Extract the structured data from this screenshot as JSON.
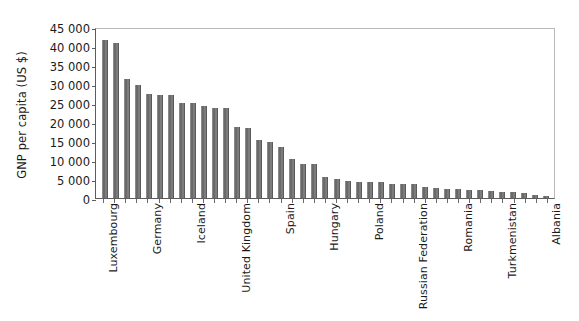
{
  "figure": {
    "top_clipped_text": "",
    "background_color": "#ffffff",
    "bar_color": "#6a6a6a",
    "axis_color": "#5c5c5c"
  },
  "chart_data": {
    "type": "bar",
    "title": "",
    "xlabel": "",
    "ylabel": "GNP per capita (US $)",
    "ylim": [
      0,
      45000
    ],
    "ytick_values": [
      0,
      5000,
      10000,
      15000,
      20000,
      25000,
      30000,
      35000,
      40000,
      45000
    ],
    "ytick_labels": [
      "0",
      "5 000",
      "10 000",
      "15 000",
      "20 000",
      "25 000",
      "30 000",
      "35 000",
      "40 000",
      "45 000"
    ],
    "grid": false,
    "legend": null,
    "labelled_categories": [
      "Luxembourg",
      "Germany",
      "Iceland",
      "United Kingdom",
      "Spain",
      "Hungary",
      "Poland",
      "Russian Federation",
      "Romania",
      "Turkmenistan",
      "Albania"
    ],
    "label_every_nth_bar": 5,
    "categories": [
      "Luxembourg",
      "",
      "",
      "",
      "Germany",
      "",
      "",
      "",
      "Iceland",
      "",
      "",
      "",
      "United Kingdom",
      "",
      "",
      "",
      "Spain",
      "",
      "",
      "",
      "Hungary",
      "",
      "",
      "",
      "Poland",
      "",
      "",
      "",
      "Russian Federation",
      "",
      "",
      "",
      "Romania",
      "",
      "",
      "",
      "Turkmenistan",
      "",
      "",
      "",
      "Albania"
    ],
    "values": [
      41500,
      40700,
      31200,
      29800,
      27400,
      27200,
      27000,
      25000,
      25000,
      24200,
      23700,
      23700,
      18600,
      18400,
      15300,
      14700,
      13500,
      10200,
      9000,
      8900,
      5400,
      5000,
      4500,
      4300,
      4200,
      4300,
      3800,
      3700,
      3800,
      3000,
      2600,
      2500,
      2400,
      2200,
      2000,
      1900,
      1700,
      1500,
      1300,
      900,
      600
    ]
  }
}
